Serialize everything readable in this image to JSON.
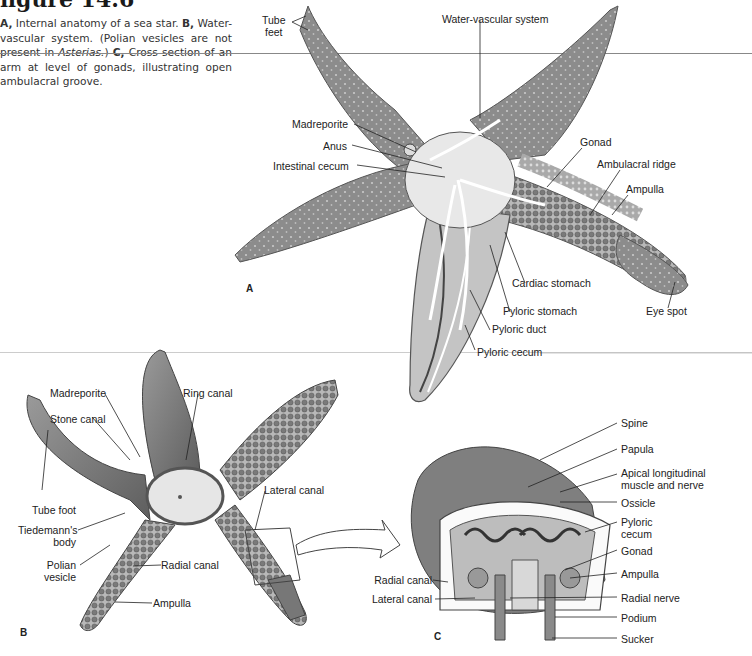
{
  "figure": {
    "title": "figure 14.6",
    "caption": {
      "a_key": "A,",
      "a_text": " Internal anatomy of a sea star. ",
      "b_key": "B,",
      "b_text": " Water-vascular system. (Polian vesicles are not present in ",
      "b_italic": "Asterias.",
      "b_close": ") ",
      "c_key": "C,",
      "c_text": " Cross section of an arm at level of gonads, illustrating open ambulacral groove."
    }
  },
  "panels": {
    "a": {
      "letter": "A",
      "labels": {
        "tube_feet_1": "Tube",
        "tube_feet_2": "feet",
        "water_vascular": "Water-vascular system",
        "madreporite": "Madreporite",
        "anus": "Anus",
        "intestinal_cecum": "Intestinal cecum",
        "gonad": "Gonad",
        "ambulacral_ridge": "Ambulacral ridge",
        "ampulla": "Ampulla",
        "cardiac_stomach": "Cardiac stomach",
        "pyloric_stomach": "Pyloric stomach",
        "pyloric_duct": "Pyloric duct",
        "pyloric_cecum": "Pyloric cecum",
        "eye_spot": "Eye spot"
      }
    },
    "b": {
      "letter": "B",
      "labels": {
        "madreporite": "Madreporite",
        "ring_canal": "Ring canal",
        "stone_canal": "Stone canal",
        "tube_foot": "Tube foot",
        "tiedemann_1": "Tiedemann's",
        "tiedemann_2": "body",
        "polian_1": "Polian",
        "polian_2": "vesicle",
        "radial_canal": "Radial canal",
        "ampulla": "Ampulla",
        "lateral_canal": "Lateral canal"
      }
    },
    "c": {
      "letter": "C",
      "labels": {
        "spine": "Spine",
        "papula": "Papula",
        "apical_1": "Apical longitudinal",
        "apical_2": "muscle and nerve",
        "ossicle": "Ossicle",
        "pyloric_cecum_1": "Pyloric",
        "pyloric_cecum_2": "cecum",
        "gonad": "Gonad",
        "ampulla": "Ampulla",
        "radial_nerve": "Radial nerve",
        "podium": "Podium",
        "sucker": "Sucker",
        "radial_canal": "Radial canal",
        "lateral_canal": "Lateral canal"
      }
    }
  },
  "colors": {
    "skin": "#8a8a8a",
    "skin_dark": "#6e6e6e",
    "interior": "#d6d6d6",
    "line": "#333333"
  }
}
